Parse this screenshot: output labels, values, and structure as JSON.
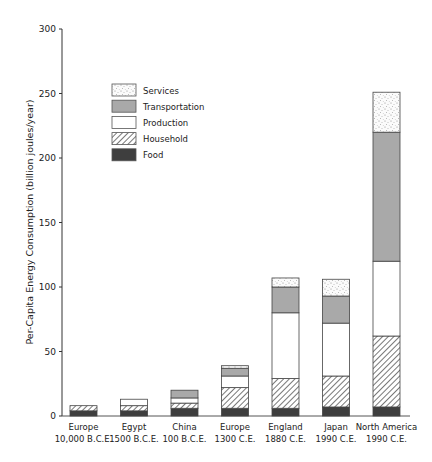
{
  "chart_data": {
    "type": "bar",
    "stacked": true,
    "title": "",
    "xlabel": "",
    "ylabel": "Per-Capita Energy Consumption (billion joules/year)",
    "ylim": [
      0,
      300
    ],
    "yticks": [
      0,
      50,
      100,
      150,
      200,
      250,
      300
    ],
    "grid": false,
    "legend_position": "upper-left-inside",
    "categories": [
      {
        "name": "Europe",
        "date": "10,000 B.C.E."
      },
      {
        "name": "Egypt",
        "date": "1500 B.C.E."
      },
      {
        "name": "China",
        "date": "100 B.C.E."
      },
      {
        "name": "Europe",
        "date": "1300 C.E."
      },
      {
        "name": "England",
        "date": "1880 C.E."
      },
      {
        "name": "Japan",
        "date": "1990 C.E."
      },
      {
        "name": "North America",
        "date": "1990 C.E."
      }
    ],
    "series": [
      {
        "name": "Food",
        "fill": "solid-dark",
        "color": "#3d3d3d",
        "values": [
          4,
          4,
          6,
          6,
          6,
          7,
          7
        ]
      },
      {
        "name": "Household",
        "fill": "hatched",
        "color": "#9a9a9a",
        "values": [
          4,
          4,
          4,
          16,
          23,
          24,
          55
        ]
      },
      {
        "name": "Production",
        "fill": "white",
        "color": "#ffffff",
        "values": [
          0,
          5,
          4,
          9,
          51,
          41,
          58
        ]
      },
      {
        "name": "Transportation",
        "fill": "solid-gray",
        "color": "#a8a8a8",
        "values": [
          0,
          0,
          6,
          6,
          20,
          21,
          100
        ]
      },
      {
        "name": "Services",
        "fill": "stippled",
        "color": "#f2f2f2",
        "values": [
          0,
          0,
          0,
          2,
          7,
          13,
          31
        ]
      }
    ],
    "legend_order": [
      "Services",
      "Transportation",
      "Production",
      "Household",
      "Food"
    ]
  }
}
